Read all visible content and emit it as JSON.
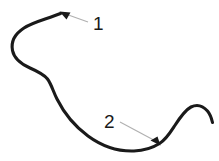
{
  "figure": {
    "background_color": "#ffffff",
    "width": 219,
    "height": 161
  },
  "curve": {
    "name": "freeform-s-curve",
    "color": "#1a1a1a",
    "stroke_width": 3.1,
    "description": "Thick open curve: hooks up-left into an arrow tip at top, sweeps down through an S-inflection, bottoms out in a trough, then rises over a rounded hump and tapers off at the right edge.",
    "path": "M 60.5 13.5 C 47 19 33 22 24 28 C 14 34.5 11 43 12.5 50.5 C 14 58 21 64 30 68 C 38 71.5 44 74.5 47.5 79 C 51.5 84.5 53 91 57 99 C 63 111 73 125 88 136 C 103 147 120 151.5 134 151 C 146 150.5 154 147 159.5 143.5 C 166 139.5 170 133 174.5 126 C 180 117.5 185 110 191 107 C 197 104 203 106 207.5 111 C 210 114 211.5 118 212.5 122.5"
  },
  "callouts": [
    {
      "id": "callout-1",
      "label": "1",
      "label_x": 93,
      "label_y": 30,
      "label_font_size": 19,
      "label_color": "#1a1a1a",
      "leader": {
        "color": "#b0b0b0",
        "stroke_width": 1.1,
        "path": "M 88 22 L 63.5 13.2"
      },
      "arrow": {
        "name": "arrowhead-1",
        "color": "#1a1a1a",
        "tip_x": 59.5,
        "tip_y": 11.5,
        "points": "59.5,11.5 70.5,12.5 66.5,19.5"
      },
      "points_at": "upper hook terminus of the curve"
    },
    {
      "id": "callout-2",
      "label": "2",
      "label_x": 104,
      "label_y": 128,
      "label_font_size": 19,
      "label_color": "#1a1a1a",
      "leader": {
        "color": "#b0b0b0",
        "stroke_width": 1.1,
        "path": "M 120 122 L 156.5 141.5"
      },
      "arrow": {
        "name": "arrowhead-2",
        "color": "#1a1a1a",
        "tip_x": 160.5,
        "tip_y": 145.5,
        "points": "160.5,145.5 150.5,140.5 157.5,136.5"
      },
      "points_at": "lower trough where the curve turns upward"
    }
  ]
}
